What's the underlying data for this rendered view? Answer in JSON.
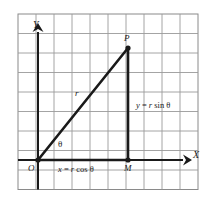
{
  "figure": {
    "name": "polar-to-rectangular-coordinates-diagram",
    "kind": "geometry-diagram",
    "grid": {
      "columns": 10,
      "rows": 9,
      "cell_width_px": 18,
      "cell_height_px": 19.5,
      "line_color": "#9a9a9a",
      "border_color": "#8a8a8a",
      "background_color": "#ffffff"
    },
    "stroke_color": "#1a1a1a",
    "labels": {
      "y_axis": "Y",
      "x_axis": "X",
      "origin": "O",
      "point_p": "P",
      "point_m": "M",
      "radius": "r",
      "angle": "θ",
      "x_equation": {
        "lhs": "x",
        "equals": "=",
        "coefficient": "r",
        "function": "cos",
        "argument": "θ",
        "full": "x = r cos θ"
      },
      "y_equation": {
        "lhs": "y",
        "equals": "=",
        "coefficient": "r",
        "function": "sin",
        "argument": "θ",
        "full": "y = r sin θ"
      }
    },
    "geometry": {
      "origin_px": [
        38,
        160
      ],
      "point_p_px": [
        128,
        48
      ],
      "point_m_px": [
        128,
        160
      ],
      "x_axis_arrow_tip_px": [
        188,
        160
      ],
      "y_axis_arrow_tip_px": [
        38,
        27
      ]
    }
  }
}
